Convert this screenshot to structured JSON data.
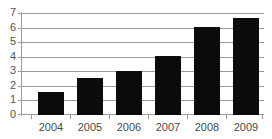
{
  "chart_data": {
    "type": "bar",
    "title": "",
    "subtitle": "",
    "xlabel": "",
    "ylabel": "",
    "categories": [
      "2004",
      "2005",
      "2006",
      "2007",
      "2008",
      "2009"
    ],
    "values": [
      1.6,
      2.55,
      3.05,
      4.1,
      6.1,
      6.7
    ],
    "series": [
      {
        "name": "",
        "values": [
          1.6,
          2.55,
          3.05,
          4.1,
          6.1,
          6.7
        ]
      }
    ],
    "ylim": [
      0,
      7
    ],
    "xlim": [
      0,
      6
    ],
    "y_ticks": [
      "0",
      "1",
      "2",
      "3",
      "4",
      "5",
      "6",
      "7"
    ],
    "y_tick_values": [
      0,
      1,
      2,
      3,
      4,
      5,
      6,
      7
    ],
    "x_ticks": [
      "2004",
      "2005",
      "2006",
      "2007",
      "2008",
      "2009"
    ],
    "grid": true,
    "grid_axis": "y",
    "legend": false,
    "legend_position": "none",
    "annotations": [],
    "bar_color": "#0b0b0b",
    "grid_color": "#9a9a9a",
    "axis_color": "#9a9a9a",
    "background_color": "#ffffff",
    "tick_label_color": "#4a4a4a"
  }
}
